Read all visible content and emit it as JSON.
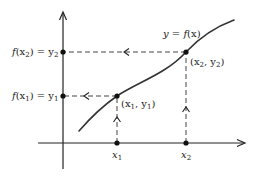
{
  "diagram": {
    "curve_label": "y = f(x)",
    "points": [
      {
        "name": "point-1",
        "label": "(x1, y1)",
        "x_label": "x1",
        "y_label": "f(x1) = y1"
      },
      {
        "name": "point-2",
        "label": "(x2, y2)",
        "x_label": "x2",
        "y_label": "f(x2) = y2"
      }
    ],
    "labels": {
      "curve": {
        "pre": "y = ",
        "fn": "f",
        "arg": "(x)"
      },
      "p1": {
        "open": "(x",
        "sub1": "1",
        "mid": ", y",
        "sub2": "1",
        "close": ")"
      },
      "p2": {
        "open": "(x",
        "sub1": "2",
        "mid": ", y",
        "sub2": "2",
        "close": ")"
      },
      "x1": {
        "base": "x",
        "sub": "1"
      },
      "x2": {
        "base": "x",
        "sub": "2"
      },
      "fy1": {
        "fn": "f",
        "open": "(x",
        "sub": "1",
        "close": ")",
        "eq": " = y",
        "ysub": "1"
      },
      "fy2": {
        "fn": "f",
        "open": "(x",
        "sub": "2",
        "close": ")",
        "eq": " = y",
        "ysub": "2"
      }
    },
    "colors": {
      "ink": "#222222",
      "curve": "#333333",
      "dash": "#444444",
      "background": "#ffffff"
    }
  }
}
